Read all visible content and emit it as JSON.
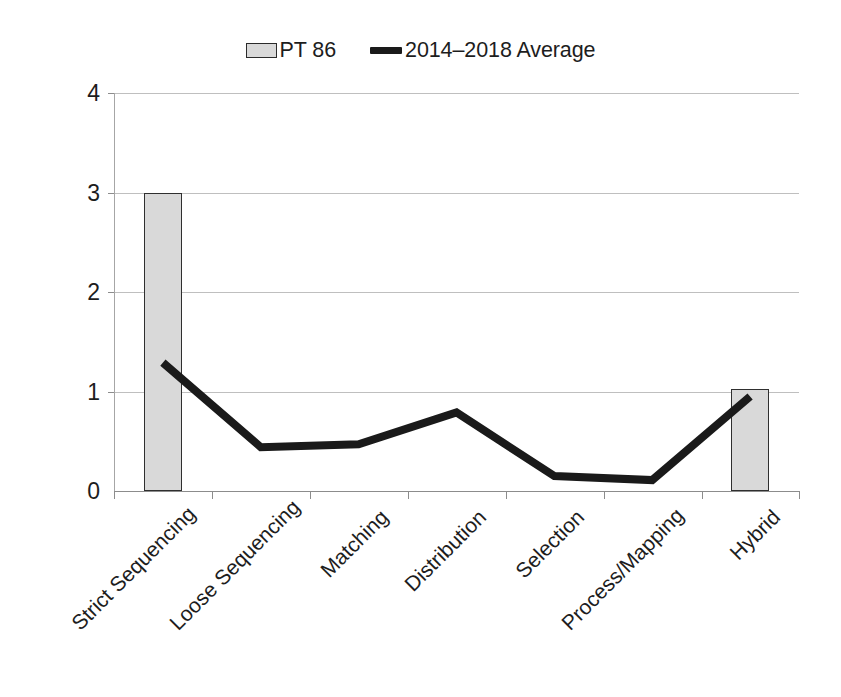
{
  "legend": {
    "entries": [
      {
        "label": "PT 86",
        "type": "bar",
        "color": "#d9d9d9",
        "border_color": "#2f2f2f"
      },
      {
        "label": "2014–2018 Average",
        "type": "line",
        "color": "#1a1a1a"
      }
    ]
  },
  "axes": {
    "y_tick_labels": [
      "4",
      "3",
      "2",
      "1",
      "0"
    ],
    "x_tick_labels": [
      "Strict Sequencing",
      "Loose Sequencing",
      "Matching",
      "Distribution",
      "Selection",
      "Process/Mapping",
      "Hybrid"
    ]
  },
  "chart_data": {
    "type": "bar",
    "title": "",
    "xlabel": "",
    "ylabel": "",
    "ylim": [
      0,
      4
    ],
    "yticks": [
      0,
      1,
      2,
      3,
      4
    ],
    "grid": true,
    "legend_position": "top-center",
    "categories": [
      "Strict Sequencing",
      "Loose Sequencing",
      "Matching",
      "Distribution",
      "Selection",
      "Process/Mapping",
      "Hybrid"
    ],
    "series": [
      {
        "name": "PT 86",
        "type": "bar",
        "color": "#d9d9d9",
        "border_color": "#2f2f2f",
        "values": [
          3,
          0,
          0,
          0,
          0,
          0,
          1.03
        ]
      },
      {
        "name": "2014–2018 Average",
        "type": "line",
        "color": "#1a1a1a",
        "values": [
          1.29,
          0.44,
          0.47,
          0.79,
          0.15,
          0.11,
          0.95
        ]
      }
    ]
  }
}
